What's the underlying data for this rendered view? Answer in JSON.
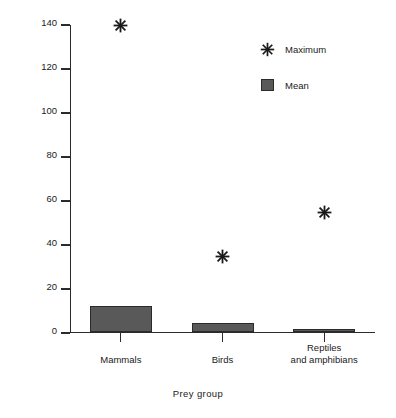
{
  "chart_data": {
    "type": "bar",
    "title": "",
    "xlabel": "Prey group",
    "ylabel": "Number predated",
    "categories": [
      "Mammals",
      "Birds",
      "Reptiles\nand amphibians"
    ],
    "category_labels": [
      {
        "line1": "Mammals",
        "line2": ""
      },
      {
        "line1": "Birds",
        "line2": ""
      },
      {
        "line1": "Reptiles",
        "line2": "and amphibians"
      }
    ],
    "series": [
      {
        "name": "Mean",
        "type": "bar",
        "values": [
          11.5,
          4,
          0.7
        ]
      },
      {
        "name": "Maximum",
        "type": "scatter",
        "values": [
          140,
          35,
          55
        ]
      }
    ],
    "ylim": [
      0,
      140
    ],
    "yticks": [
      0,
      20,
      40,
      60,
      80,
      100,
      120,
      140
    ],
    "ytick_labels": [
      "0",
      "20",
      "40",
      "60",
      "80",
      "100",
      "120",
      "140"
    ],
    "grid": false,
    "legend_position": "upper right",
    "legend": [
      {
        "label": "Maximum",
        "marker": "asterisk-icon"
      },
      {
        "label": "Mean",
        "marker": "square-swatch-icon"
      }
    ],
    "colors": {
      "bar_fill": "#595959",
      "bar_edge": "#2b2b2b",
      "marker": "#1a1a1a",
      "axis": "#2b2b2b",
      "background": "#ffffff"
    }
  }
}
